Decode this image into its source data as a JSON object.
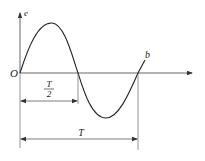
{
  "diagram": {
    "type": "sine-wave-period",
    "axes": {
      "origin_label": "O",
      "y_label": "e",
      "x_label": ""
    },
    "curve": {
      "end_label": "b",
      "color": "#222222"
    },
    "dimensions": {
      "half_period": {
        "numerator": "T",
        "denominator": "2"
      },
      "full_period": {
        "label": "T"
      }
    }
  }
}
